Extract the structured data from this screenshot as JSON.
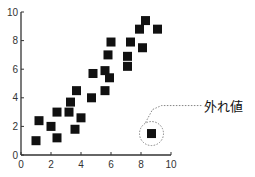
{
  "chart_data": {
    "type": "scatter",
    "title": "",
    "xlabel": "",
    "ylabel": "",
    "xlim": [
      0,
      10
    ],
    "ylim": [
      0,
      10
    ],
    "xticks": [
      0,
      2,
      4,
      6,
      8,
      10
    ],
    "yticks": [
      0,
      2,
      4,
      6,
      8,
      10
    ],
    "grid": false,
    "legend": null,
    "marker": "square",
    "marker_color": "#111111",
    "series": [
      {
        "name": "data",
        "points": [
          [
            1.0,
            1.0
          ],
          [
            1.2,
            2.4
          ],
          [
            2.0,
            2.0
          ],
          [
            2.4,
            1.2
          ],
          [
            2.4,
            3.0
          ],
          [
            3.2,
            3.0
          ],
          [
            3.3,
            3.7
          ],
          [
            3.6,
            1.8
          ],
          [
            3.7,
            4.5
          ],
          [
            4.0,
            2.6
          ],
          [
            4.7,
            4.0
          ],
          [
            4.8,
            5.7
          ],
          [
            5.6,
            4.5
          ],
          [
            5.6,
            5.9
          ],
          [
            5.9,
            5.4
          ],
          [
            5.8,
            7.0
          ],
          [
            6.0,
            7.9
          ],
          [
            7.1,
            6.2
          ],
          [
            7.1,
            6.9
          ],
          [
            7.3,
            7.9
          ],
          [
            7.9,
            8.8
          ],
          [
            8.1,
            7.5
          ],
          [
            8.3,
            9.4
          ],
          [
            9.1,
            8.8
          ]
        ]
      },
      {
        "name": "outlier",
        "points": [
          [
            8.7,
            1.5
          ]
        ]
      }
    ],
    "annotations": [
      {
        "text": "外れ値",
        "target": [
          8.7,
          1.5
        ],
        "style": "dotted circle with dotted leader line"
      }
    ]
  }
}
